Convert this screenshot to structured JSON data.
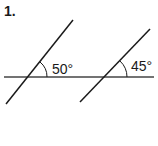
{
  "problem": {
    "number": "1.",
    "angles": [
      {
        "label": "50°",
        "value": 50
      },
      {
        "label": "45°",
        "value": 45
      }
    ]
  }
}
